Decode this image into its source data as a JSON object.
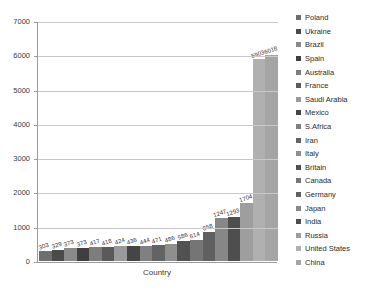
{
  "chart_data": {
    "type": "bar",
    "title": "",
    "xlabel": "Country",
    "ylabel": "",
    "ylim": [
      0,
      7000
    ],
    "ytick_values": [
      0,
      1000,
      2000,
      3000,
      4000,
      5000,
      6000,
      7000
    ],
    "ytick_labels": [
      "0",
      "1000",
      "2000",
      "3000",
      "4000",
      "5000",
      "6000",
      "7000"
    ],
    "grid": true,
    "legend_position": "right",
    "categories": [
      "Poland",
      "Ukraine",
      "Brazil",
      "Spain",
      "Australia",
      "France",
      "Saudi Arabia",
      "Mexico",
      "S.Africa",
      "Iran",
      "Italy",
      "Britain",
      "Canada",
      "Germany",
      "Japan",
      "India",
      "Russia",
      "United States",
      "China"
    ],
    "values": [
      303,
      329,
      373,
      373,
      417,
      418,
      424,
      436,
      444,
      471,
      486,
      586,
      614,
      858,
      1247,
      1293,
      1704,
      5903,
      6018
    ],
    "data_labels": [
      "303",
      "329",
      "373",
      "373",
      "417",
      "418",
      "424",
      "436",
      "444",
      "471",
      "486",
      "586",
      "614",
      "858",
      "1247",
      "1293",
      "1704",
      "5903",
      "6018"
    ],
    "bar_colors": [
      "#6e6e6e",
      "#4a4a4a",
      "#8a8a8a",
      "#3f3f3f",
      "#7d7d7d",
      "#5a5a5a",
      "#9a9a9a",
      "#454545",
      "#808080",
      "#636363",
      "#8f8f8f",
      "#515151",
      "#757575",
      "#606060",
      "#878787",
      "#4e4e4e",
      "#9e9e9e",
      "#b0b0b0",
      "#a5a5a5"
    ],
    "colors": {
      "axis": "#9a9a9a",
      "grid": "#c9c9c9",
      "text": "#2b2b2b",
      "background": "#ffffff"
    }
  },
  "legend": {
    "items": [
      {
        "label": "Poland",
        "color": "#6e6e6e"
      },
      {
        "label": "Ukraine",
        "color": "#4a4a4a"
      },
      {
        "label": "Brazil",
        "color": "#8a8a8a"
      },
      {
        "label": "Spain",
        "color": "#3f3f3f"
      },
      {
        "label": "Australia",
        "color": "#7d7d7d"
      },
      {
        "label": "France",
        "color": "#5a5a5a"
      },
      {
        "label": "Saudi Arabia",
        "color": "#9a9a9a"
      },
      {
        "label": "Mexico",
        "color": "#454545"
      },
      {
        "label": "S.Africa",
        "color": "#808080"
      },
      {
        "label": "Iran",
        "color": "#636363"
      },
      {
        "label": "Italy",
        "color": "#8f8f8f"
      },
      {
        "label": "Britain",
        "color": "#515151"
      },
      {
        "label": "Canada",
        "color": "#757575"
      },
      {
        "label": "Germany",
        "color": "#606060"
      },
      {
        "label": "Japan",
        "color": "#878787"
      },
      {
        "label": "India",
        "color": "#4e4e4e"
      },
      {
        "label": "Russia",
        "color": "#9e9e9e"
      },
      {
        "label": "United States",
        "color": "#b0b0b0"
      },
      {
        "label": "China",
        "color": "#a5a5a5"
      }
    ]
  }
}
